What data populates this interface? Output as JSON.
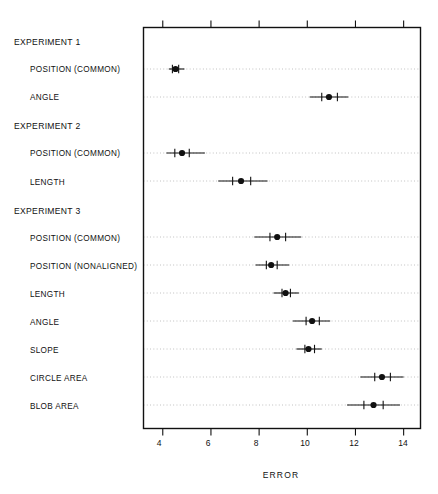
{
  "chart_data": {
    "type": "scatter",
    "title": "",
    "xlabel": "ERROR",
    "ylabel": "",
    "xlim": [
      3.2,
      14.7
    ],
    "xticks": [
      4,
      6,
      8,
      10,
      12,
      14
    ],
    "xticklabels": [
      "4",
      "6",
      "8",
      "10",
      "12",
      "14"
    ],
    "grid": "horizontal-dotted",
    "legend": "none",
    "orientation": "horizontal",
    "marker": "filled-circle-with-error-bars",
    "groups": [
      {
        "name": "EXPERIMENT 1",
        "rows": [
          {
            "label": "POSITION (COMMON)",
            "value": 4.53,
            "low": 4.25,
            "high": 4.9,
            "cap_low": 4.4,
            "cap_high": 4.66
          },
          {
            "label": "ANGLE",
            "value": 10.9,
            "low": 10.1,
            "high": 11.7,
            "cap_low": 10.6,
            "cap_high": 11.25
          }
        ]
      },
      {
        "name": "EXPERIMENT 2",
        "rows": [
          {
            "label": "POSITION (COMMON)",
            "value": 4.8,
            "low": 4.15,
            "high": 5.75,
            "cap_low": 4.5,
            "cap_high": 5.1
          },
          {
            "label": "LENGTH",
            "value": 7.25,
            "low": 6.3,
            "high": 8.35,
            "cap_low": 6.9,
            "cap_high": 7.65
          }
        ]
      },
      {
        "name": "EXPERIMENT 3",
        "rows": [
          {
            "label": "POSITION (COMMON)",
            "value": 8.75,
            "low": 7.8,
            "high": 9.75,
            "cap_low": 8.45,
            "cap_high": 9.1
          },
          {
            "label": "POSITION (NONALIGNED)",
            "value": 8.5,
            "low": 7.85,
            "high": 9.25,
            "cap_low": 8.3,
            "cap_high": 8.75
          },
          {
            "label": "LENGTH",
            "value": 9.1,
            "low": 8.6,
            "high": 9.65,
            "cap_low": 8.95,
            "cap_high": 9.3
          },
          {
            "label": "ANGLE",
            "value": 10.2,
            "low": 9.4,
            "high": 10.95,
            "cap_low": 9.95,
            "cap_high": 10.5
          },
          {
            "label": "SLOPE",
            "value": 10.05,
            "low": 9.55,
            "high": 10.6,
            "cap_low": 9.9,
            "cap_high": 10.3
          },
          {
            "label": "CIRCLE AREA",
            "value": 13.1,
            "low": 12.2,
            "high": 14.0,
            "cap_low": 12.8,
            "cap_high": 13.45
          },
          {
            "label": "BLOB AREA",
            "value": 12.75,
            "low": 11.65,
            "high": 13.85,
            "cap_low": 12.35,
            "cap_high": 13.15
          }
        ]
      }
    ]
  },
  "axis": {
    "xlabel": "ERROR",
    "tick_4": "4",
    "tick_6": "6",
    "tick_8": "8",
    "tick_10": "10",
    "tick_12": "12",
    "tick_14": "14"
  },
  "labels": {
    "g1": "EXPERIMENT 1",
    "g1r1": "POSITION (COMMON)",
    "g1r2": "ANGLE",
    "g2": "EXPERIMENT 2",
    "g2r1": "POSITION (COMMON)",
    "g2r2": "LENGTH",
    "g3": "EXPERIMENT 3",
    "g3r1": "POSITION (COMMON)",
    "g3r2": "POSITION (NONALIGNED)",
    "g3r3": "LENGTH",
    "g3r4": "ANGLE",
    "g3r5": "SLOPE",
    "g3r6": "CIRCLE AREA",
    "g3r7": "BLOB AREA"
  },
  "colors": {
    "ink": "#111111",
    "background": "#ffffff",
    "grid": "#aaaaaa"
  }
}
